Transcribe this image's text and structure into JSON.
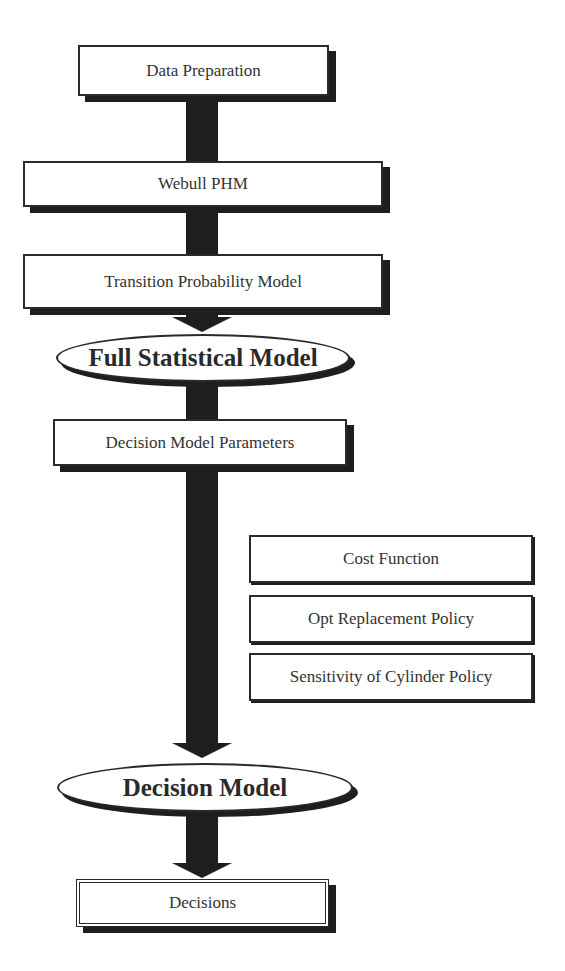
{
  "diagram": {
    "type": "flowchart",
    "nodes": {
      "data_preparation": {
        "label": "Data Preparation",
        "shape": "box"
      },
      "webull_phm": {
        "label": "Webull PHM",
        "shape": "box"
      },
      "transition_probability_model": {
        "label": "Transition Probability Model",
        "shape": "box"
      },
      "full_statistical_model": {
        "label": "Full Statistical Model",
        "shape": "ellipse"
      },
      "decision_model_parameters": {
        "label": "Decision Model Parameters",
        "shape": "box"
      },
      "cost_function": {
        "label": "Cost Function",
        "shape": "box"
      },
      "opt_replacement_policy": {
        "label": "Opt Replacement Policy",
        "shape": "box"
      },
      "sensitivity_of_cylinder_policy": {
        "label": "Sensitivity of Cylinder Policy",
        "shape": "box"
      },
      "decision_model": {
        "label": "Decision Model",
        "shape": "ellipse"
      },
      "decisions": {
        "label": "Decisions",
        "shape": "double-box"
      }
    },
    "edges": [
      {
        "from": "Data Preparation",
        "to": "Webull PHM",
        "style": "thick-line"
      },
      {
        "from": "Webull PHM",
        "to": "Transition Probability Model",
        "style": "thick-line"
      },
      {
        "from": "Transition Probability Model",
        "to": "Full Statistical Model",
        "style": "thick-arrow"
      },
      {
        "from": "Full Statistical Model",
        "to": "Decision Model Parameters",
        "style": "thick-line"
      },
      {
        "from": "Decision Model Parameters",
        "to": "Decision Model",
        "style": "thick-arrow"
      },
      {
        "from": "Decision Model",
        "to": "Decisions",
        "style": "thick-arrow"
      }
    ],
    "side_group": [
      "Cost Function",
      "Opt Replacement Policy",
      "Sensitivity of Cylinder Policy"
    ],
    "colors": {
      "arrow": "#1e1e1e",
      "border": "#2a2a2a",
      "text": "#333333",
      "background": "#ffffff"
    }
  }
}
